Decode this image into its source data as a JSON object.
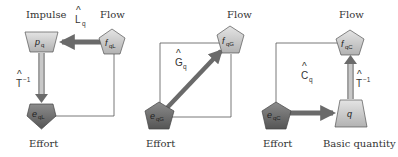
{
  "colors": {
    "light_node": "#c9c9c9",
    "dark_node": "#6e6e6e",
    "arrow": "#6a6a6a",
    "line": "#555555",
    "text": "#333333"
  },
  "panels": [
    {
      "id": "inductive",
      "top_left_label": "Impulse",
      "top_right_label": "Flow",
      "bottom_label": "Effort",
      "operator_top": {
        "symbol": "L",
        "hat": "^",
        "subscript": "q"
      },
      "operator_side": {
        "symbol": "T",
        "hat": "^",
        "superscript": "−1"
      },
      "nodes": {
        "impulse": {
          "base": "p",
          "subscript": "q"
        },
        "flow": {
          "base": "f",
          "subscript": "qL"
        },
        "effort": {
          "base": "e",
          "subscript": "qL"
        }
      }
    },
    {
      "id": "conductive",
      "top_right_label": "Flow",
      "bottom_label": "Effort",
      "operator_diag": {
        "symbol": "G",
        "hat": "^",
        "subscript": "q"
      },
      "nodes": {
        "flow": {
          "base": "f",
          "subscript": "qG"
        },
        "effort": {
          "base": "e",
          "subscript": "qG"
        }
      }
    },
    {
      "id": "capacitive",
      "top_label": "Flow",
      "bottom_left_label": "Effort",
      "bottom_right_label": "Basic quantity",
      "operator_bottom": {
        "symbol": "C",
        "hat": "^",
        "subscript": "q"
      },
      "operator_side": {
        "symbol": "T",
        "hat": "^",
        "superscript": "−1"
      },
      "nodes": {
        "flow": {
          "base": "f",
          "subscript": "qC"
        },
        "effort": {
          "base": "e",
          "subscript": "qC"
        },
        "basic_quantity": {
          "base": "q",
          "subscript": ""
        }
      }
    }
  ]
}
